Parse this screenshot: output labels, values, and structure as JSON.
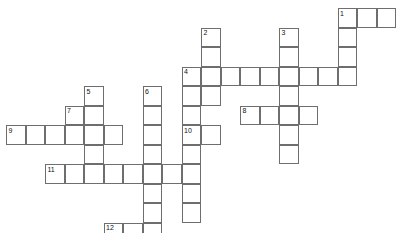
{
  "puzzle": {
    "kind": "crossword-grid",
    "title": "",
    "background_color": "#ffffff",
    "cell_fill_color": "#ffffff",
    "cell_border_color": "#6e6e6e",
    "number_color": "#111111",
    "cell_size_px": 19.5,
    "origin_x_px": 6,
    "origin_y_px": 8,
    "columns": 20,
    "rows": 12,
    "numbered_clues": [
      {
        "number": "1",
        "col": 17,
        "row": 0
      },
      {
        "number": "2",
        "col": 10,
        "row": 1
      },
      {
        "number": "3",
        "col": 14,
        "row": 1
      },
      {
        "number": "4",
        "col": 9,
        "row": 3
      },
      {
        "number": "5",
        "col": 4,
        "row": 4
      },
      {
        "number": "6",
        "col": 7,
        "row": 4
      },
      {
        "number": "7",
        "col": 3,
        "row": 5
      },
      {
        "number": "8",
        "col": 12,
        "row": 5
      },
      {
        "number": "9",
        "col": 0,
        "row": 6
      },
      {
        "number": "10",
        "col": 9,
        "row": 6
      },
      {
        "number": "11",
        "col": 2,
        "row": 8
      },
      {
        "number": "12",
        "col": 5,
        "row": 11
      }
    ],
    "entries": [
      {
        "id": "1-across",
        "number": "1",
        "direction": "across",
        "col": 17,
        "row": 0,
        "length": 3
      },
      {
        "id": "1-down",
        "number": "1",
        "direction": "down",
        "col": 17,
        "row": 0,
        "length": 4
      },
      {
        "id": "2-down",
        "number": "2",
        "direction": "down",
        "col": 10,
        "row": 1,
        "length": 6
      },
      {
        "id": "3-down",
        "number": "3",
        "direction": "down",
        "col": 14,
        "row": 1,
        "length": 6
      },
      {
        "id": "4-across",
        "number": "4",
        "direction": "across",
        "col": 9,
        "row": 3,
        "length": 9
      },
      {
        "id": "5-down",
        "number": "5",
        "direction": "down",
        "col": 4,
        "row": 4,
        "length": 5
      },
      {
        "id": "6-down",
        "number": "6",
        "direction": "down",
        "col": 7,
        "row": 4,
        "length": 8
      },
      {
        "id": "7-down",
        "number": "7",
        "direction": "down",
        "col": 3,
        "row": 5,
        "length": 2
      },
      {
        "id": "8-across",
        "number": "8",
        "direction": "across",
        "col": 12,
        "row": 5,
        "length": 4
      },
      {
        "id": "9-across",
        "number": "9",
        "direction": "across",
        "col": 0,
        "row": 6,
        "length": 6
      },
      {
        "id": "10-down",
        "number": "10",
        "direction": "down",
        "col": 9,
        "row": 6,
        "length": 5
      },
      {
        "id": "10-across",
        "number": "10",
        "direction": "across",
        "col": 9,
        "row": 6,
        "length": 2
      },
      {
        "id": "11-across",
        "number": "11",
        "direction": "across",
        "col": 2,
        "row": 8,
        "length": 7
      },
      {
        "id": "12-across",
        "number": "12",
        "direction": "across",
        "col": 5,
        "row": 11,
        "length": 3
      }
    ],
    "cells": [
      {
        "col": 17,
        "row": 0
      },
      {
        "col": 18,
        "row": 0
      },
      {
        "col": 19,
        "row": 0
      },
      {
        "col": 17,
        "row": 1
      },
      {
        "col": 10,
        "row": 1
      },
      {
        "col": 14,
        "row": 1
      },
      {
        "col": 17,
        "row": 2
      },
      {
        "col": 10,
        "row": 2
      },
      {
        "col": 14,
        "row": 2
      },
      {
        "col": 9,
        "row": 3
      },
      {
        "col": 10,
        "row": 3
      },
      {
        "col": 11,
        "row": 3
      },
      {
        "col": 12,
        "row": 3
      },
      {
        "col": 13,
        "row": 3
      },
      {
        "col": 14,
        "row": 3
      },
      {
        "col": 15,
        "row": 3
      },
      {
        "col": 16,
        "row": 3
      },
      {
        "col": 17,
        "row": 3
      },
      {
        "col": 4,
        "row": 4
      },
      {
        "col": 7,
        "row": 4
      },
      {
        "col": 9,
        "row": 4
      },
      {
        "col": 10,
        "row": 4
      },
      {
        "col": 14,
        "row": 4
      },
      {
        "col": 3,
        "row": 5
      },
      {
        "col": 4,
        "row": 5
      },
      {
        "col": 7,
        "row": 5
      },
      {
        "col": 9,
        "row": 5
      },
      {
        "col": 14,
        "row": 5
      },
      {
        "col": 12,
        "row": 5
      },
      {
        "col": 13,
        "row": 5
      },
      {
        "col": 15,
        "row": 5
      },
      {
        "col": 0,
        "row": 6
      },
      {
        "col": 1,
        "row": 6
      },
      {
        "col": 2,
        "row": 6
      },
      {
        "col": 3,
        "row": 6
      },
      {
        "col": 4,
        "row": 6
      },
      {
        "col": 5,
        "row": 6
      },
      {
        "col": 7,
        "row": 6
      },
      {
        "col": 9,
        "row": 6
      },
      {
        "col": 10,
        "row": 6
      },
      {
        "col": 14,
        "row": 6
      },
      {
        "col": 4,
        "row": 7
      },
      {
        "col": 7,
        "row": 7
      },
      {
        "col": 9,
        "row": 7
      },
      {
        "col": 14,
        "row": 7
      },
      {
        "col": 2,
        "row": 8
      },
      {
        "col": 3,
        "row": 8
      },
      {
        "col": 4,
        "row": 8
      },
      {
        "col": 5,
        "row": 8
      },
      {
        "col": 6,
        "row": 8
      },
      {
        "col": 7,
        "row": 8
      },
      {
        "col": 8,
        "row": 8
      },
      {
        "col": 9,
        "row": 8
      },
      {
        "col": 7,
        "row": 9
      },
      {
        "col": 9,
        "row": 9
      },
      {
        "col": 7,
        "row": 10
      },
      {
        "col": 9,
        "row": 10
      },
      {
        "col": 5,
        "row": 11
      },
      {
        "col": 6,
        "row": 11
      },
      {
        "col": 7,
        "row": 11
      }
    ]
  }
}
